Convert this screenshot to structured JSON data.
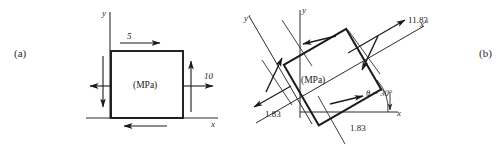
{
  "figure": {
    "width": 501,
    "height": 146,
    "background": "#ffffff",
    "ink": "#1a1a1a"
  },
  "panels": [
    {
      "key": "a",
      "caption": "(a)",
      "unit_label": "(MPa)",
      "axes": [
        {
          "name": "y-axis",
          "label": "y",
          "italic": true
        },
        {
          "name": "x-axis",
          "label": "x",
          "italic": true
        }
      ],
      "stress_labels": [
        {
          "name": "shear-top",
          "value": "5",
          "direction": "right",
          "face": "top"
        },
        {
          "name": "normal-right",
          "value": "10",
          "direction": "right",
          "face": "right"
        }
      ],
      "unlabeled_arrows": [
        {
          "name": "shear-bottom",
          "direction": "left",
          "face": "bottom"
        },
        {
          "name": "shear-left",
          "direction": "down",
          "face": "left"
        },
        {
          "name": "shear-right",
          "direction": "up",
          "face": "right"
        },
        {
          "name": "normal-left",
          "direction": "left",
          "face": "left"
        }
      ]
    },
    {
      "key": "b",
      "caption": "(b)",
      "unit_label": "(MPa)",
      "angle_label": "θ = 30°",
      "angle_value": 30,
      "axes": [
        {
          "name": "y-prime-axis",
          "label": "y′",
          "italic": true
        },
        {
          "name": "y-axis",
          "label": "y",
          "italic": true
        },
        {
          "name": "x-prime-axis",
          "label": "x′",
          "italic": true
        },
        {
          "name": "x-axis",
          "label": "x",
          "italic": true
        }
      ],
      "stress_labels": [
        {
          "name": "normal-xprime",
          "value": "11.83",
          "face": "upper-right"
        },
        {
          "name": "shear-left",
          "value": "1.83",
          "face": "lower-left"
        },
        {
          "name": "shear-bottom",
          "value": "1.83",
          "face": "bottom"
        }
      ]
    }
  ]
}
